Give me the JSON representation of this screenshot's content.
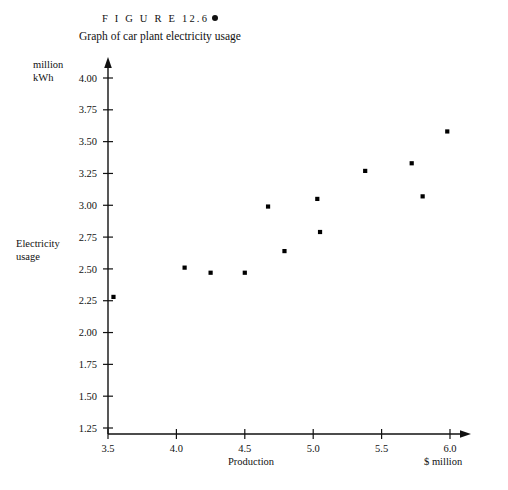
{
  "figure": {
    "number": "F I G U R E   12.6",
    "bullet_icon": "filled-circle-bullet",
    "title": "Graph of car plant electricity usage"
  },
  "labels": {
    "y_unit_line1": "million",
    "y_unit_line2": "kWh",
    "y_axis_line1": "Electricity",
    "y_axis_line2": "usage",
    "x_axis": "Production",
    "x_unit": "$ million"
  },
  "colors": {
    "ink": "#111111",
    "background": "#ffffff",
    "marker": "#000000"
  },
  "chart_data": {
    "type": "scatter",
    "title": "Graph of car plant electricity usage",
    "xlabel": "Production",
    "ylabel": "Electricity usage",
    "x_unit": "$ million",
    "y_unit": "million kWh",
    "xlim": [
      3.5,
      6.1
    ],
    "ylim": [
      1.25,
      4.05
    ],
    "grid": false,
    "legend": null,
    "xticks": [
      3.5,
      4.0,
      4.5,
      5.0,
      5.5,
      6.0
    ],
    "xticklabels": [
      "3.5",
      "4.0",
      "4.5",
      "5.0",
      "5.5",
      "6.0"
    ],
    "yticks": [
      1.25,
      1.5,
      1.75,
      2.0,
      2.25,
      2.5,
      2.75,
      3.0,
      3.25,
      3.5,
      3.75,
      4.0
    ],
    "yticklabels": [
      "1.25",
      "1.50",
      "1.75",
      "2.00",
      "2.25",
      "2.50",
      "2.75",
      "3.00",
      "3.25",
      "3.50",
      "3.75",
      "4.00"
    ],
    "series": [
      {
        "name": "Electricity usage vs production",
        "marker": "square",
        "points": [
          {
            "x": 3.54,
            "y": 2.28
          },
          {
            "x": 4.06,
            "y": 2.51
          },
          {
            "x": 4.25,
            "y": 2.47
          },
          {
            "x": 4.5,
            "y": 2.47
          },
          {
            "x": 4.67,
            "y": 2.99
          },
          {
            "x": 4.79,
            "y": 2.64
          },
          {
            "x": 5.03,
            "y": 3.05
          },
          {
            "x": 5.05,
            "y": 2.79
          },
          {
            "x": 5.38,
            "y": 3.27
          },
          {
            "x": 5.72,
            "y": 3.33
          },
          {
            "x": 5.8,
            "y": 3.07
          },
          {
            "x": 5.98,
            "y": 3.58
          }
        ]
      }
    ]
  }
}
